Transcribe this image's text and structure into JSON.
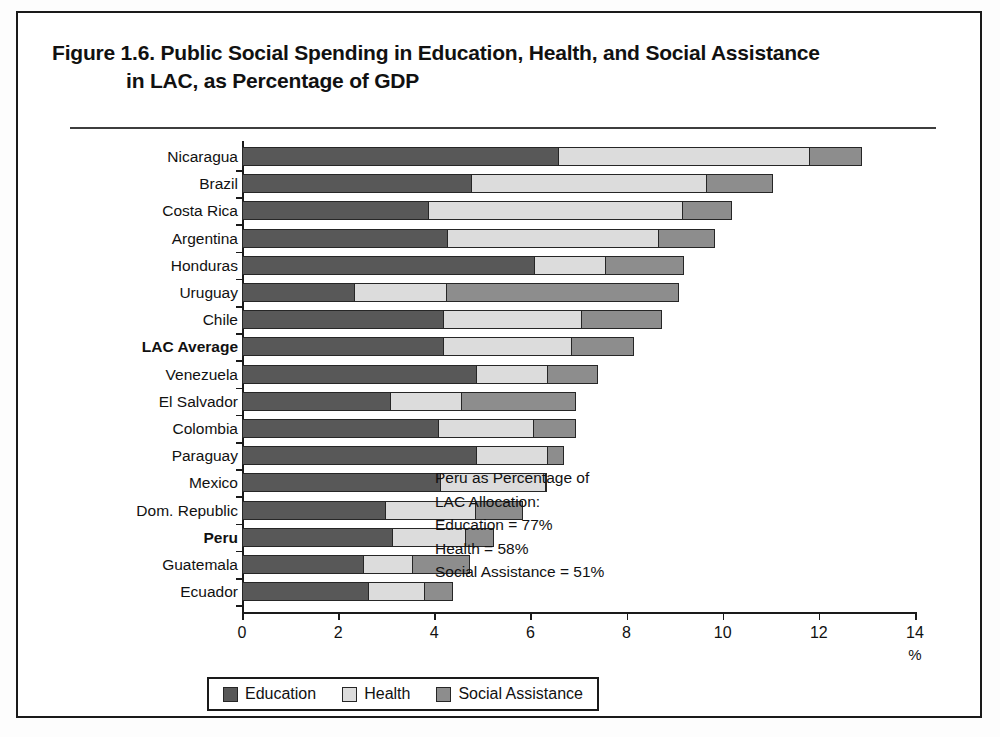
{
  "figure": {
    "title_line1": "Figure 1.6.  Public Social Spending in Education, Health, and Social Assistance",
    "title_line2": "in LAC, as Percentage of GDP"
  },
  "annotation": {
    "line1": "Peru as Percentage of",
    "line2": "LAC Allocation:",
    "line3": "Education = 77%",
    "line4": "Health = 58%",
    "line5": "Social Assistance = 51%"
  },
  "legend": {
    "items": [
      {
        "label": "Education",
        "color": "#585858"
      },
      {
        "label": "Health",
        "color": "#dcdcdc"
      },
      {
        "label": "Social Assistance",
        "color": "#8d8d8d"
      }
    ]
  },
  "axis": {
    "x_label": "%",
    "x_ticks": [
      "0",
      "2",
      "4",
      "6",
      "8",
      "10",
      "12",
      "14"
    ]
  },
  "chart_data": {
    "type": "bar",
    "orientation": "horizontal",
    "stacked": true,
    "title": "Figure 1.6.  Public Social Spending in Education, Health, and Social Assistance in LAC, as Percentage of GDP",
    "xlabel": "%",
    "ylabel": "",
    "xlim": [
      0,
      14
    ],
    "xticks": [
      0,
      2,
      4,
      6,
      8,
      10,
      12,
      14
    ],
    "grid": false,
    "legend_position": "bottom",
    "categories": [
      "Nicaragua",
      "Brazil",
      "Costa Rica",
      "Argentina",
      "Honduras",
      "Uruguay",
      "Chile",
      "LAC Average",
      "Venezuela",
      "El Salvador",
      "Colombia",
      "Paraguay",
      "Mexico",
      "Dom. Republic",
      "Peru",
      "Guatemala",
      "Ecuador"
    ],
    "highlighted_categories": [
      "LAC Average",
      "Peru"
    ],
    "series": [
      {
        "name": "Education",
        "color": "#585858",
        "values": [
          6.6,
          4.8,
          3.9,
          4.3,
          6.1,
          2.35,
          4.2,
          4.2,
          4.9,
          3.1,
          4.1,
          4.9,
          4.15,
          3.0,
          3.15,
          2.55,
          2.65
        ]
      },
      {
        "name": "Health",
        "color": "#dcdcdc",
        "values": [
          5.25,
          4.9,
          5.3,
          4.4,
          1.5,
          1.95,
          2.9,
          2.7,
          1.5,
          1.5,
          2.0,
          1.5,
          2.2,
          1.9,
          1.55,
          1.05,
          1.2
        ]
      },
      {
        "name": "Social Assistance",
        "color": "#8d8d8d",
        "values": [
          1.1,
          1.4,
          1.05,
          1.2,
          1.65,
          4.85,
          1.7,
          1.3,
          1.05,
          2.4,
          0.9,
          0.35,
          0.05,
          1.0,
          0.6,
          1.2,
          0.6
        ]
      }
    ],
    "totals": [
      12.95,
      11.1,
      10.25,
      9.9,
      9.25,
      9.15,
      8.8,
      8.2,
      7.45,
      7.0,
      7.0,
      6.75,
      6.4,
      5.9,
      5.3,
      4.8,
      4.45
    ]
  }
}
